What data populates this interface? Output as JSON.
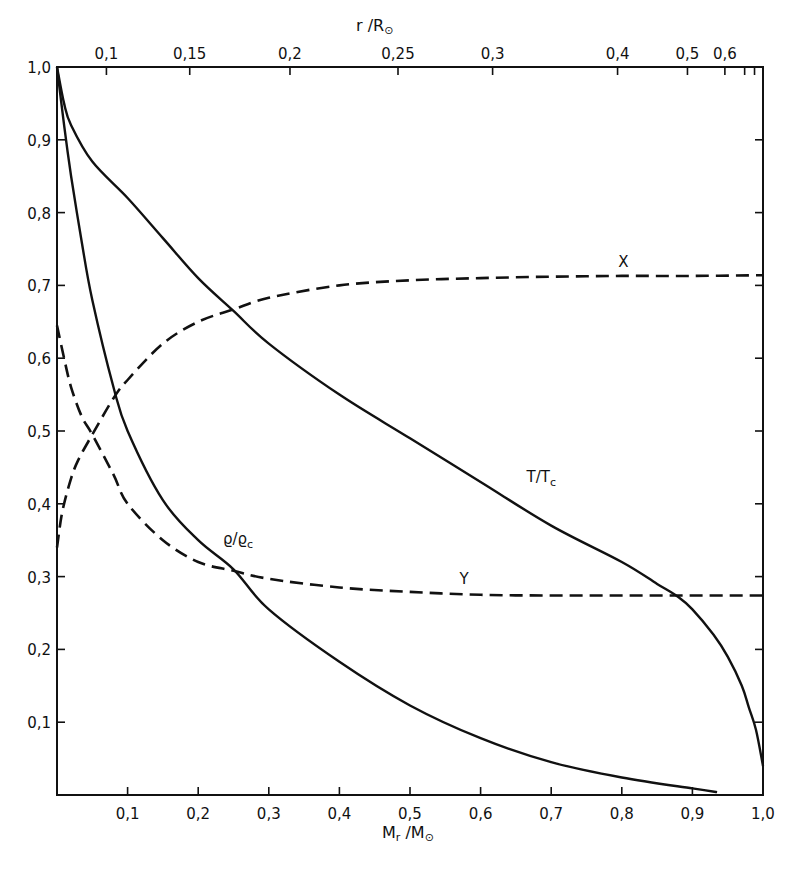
{
  "chart_data": {
    "type": "line",
    "title": "",
    "xlabel": "M_r / M_sun",
    "xlabel_main": "M",
    "xlabel_sub": "r",
    "xlabel_rest": " /M",
    "xlabel_sun": "⊙",
    "ylabel": "",
    "xlim": [
      0,
      1.0
    ],
    "ylim": [
      0,
      1.0
    ],
    "grid": false,
    "x_ticks": [
      {
        "value": 0.1,
        "label": "0,1"
      },
      {
        "value": 0.2,
        "label": "0,2"
      },
      {
        "value": 0.3,
        "label": "0,3"
      },
      {
        "value": 0.4,
        "label": "0,4"
      },
      {
        "value": 0.5,
        "label": "0,5"
      },
      {
        "value": 0.6,
        "label": "0,6"
      },
      {
        "value": 0.7,
        "label": "0,7"
      },
      {
        "value": 0.8,
        "label": "0,8"
      },
      {
        "value": 0.9,
        "label": "0,9"
      },
      {
        "value": 1.0,
        "label": "1,0"
      }
    ],
    "y_ticks": [
      {
        "value": 0.1,
        "label": "0,1"
      },
      {
        "value": 0.2,
        "label": "0,2"
      },
      {
        "value": 0.3,
        "label": "0,3"
      },
      {
        "value": 0.4,
        "label": "0,4"
      },
      {
        "value": 0.5,
        "label": "0,5"
      },
      {
        "value": 0.6,
        "label": "0,6"
      },
      {
        "value": 0.7,
        "label": "0,7"
      },
      {
        "value": 0.8,
        "label": "0,8"
      },
      {
        "value": 0.9,
        "label": "0,9"
      },
      {
        "value": 1.0,
        "label": "1,0"
      }
    ],
    "top_axis": {
      "label_main": "r /R",
      "label_sun": "⊙",
      "ticks": [
        {
          "mass_fraction": 0.07,
          "label": "0,1"
        },
        {
          "mass_fraction": 0.188,
          "label": "0,15"
        },
        {
          "mass_fraction": 0.33,
          "label": "0,2"
        },
        {
          "mass_fraction": 0.483,
          "label": "0,25"
        },
        {
          "mass_fraction": 0.617,
          "label": "0,3"
        },
        {
          "mass_fraction": 0.794,
          "label": "0,4"
        },
        {
          "mass_fraction": 0.893,
          "label": "0,5"
        },
        {
          "mass_fraction": 0.946,
          "label": "0,6"
        },
        {
          "mass_fraction": 0.974,
          "label": ""
        },
        {
          "mass_fraction": 0.988,
          "label": ""
        }
      ]
    },
    "series": [
      {
        "name": "T/Tc",
        "label": "T/T",
        "label_sub": "c",
        "style": "solid",
        "label_at": {
          "x": 0.665,
          "y": 0.43
        },
        "x": [
          0,
          0.01,
          0.02,
          0.05,
          0.1,
          0.15,
          0.2,
          0.25,
          0.3,
          0.4,
          0.5,
          0.6,
          0.7,
          0.8,
          0.85,
          0.88,
          0.9,
          0.93,
          0.95,
          0.97,
          0.98,
          0.99,
          1.0
        ],
        "values": [
          1.0,
          0.95,
          0.92,
          0.87,
          0.82,
          0.765,
          0.71,
          0.665,
          0.62,
          0.55,
          0.49,
          0.43,
          0.37,
          0.32,
          0.29,
          0.272,
          0.255,
          0.22,
          0.19,
          0.15,
          0.12,
          0.09,
          0.04
        ]
      },
      {
        "name": "rho/rho_c",
        "label": "ϱ/ϱ",
        "label_sub": "c",
        "style": "solid",
        "label_at": {
          "x": 0.235,
          "y": 0.345
        },
        "x": [
          0,
          0.01,
          0.02,
          0.035,
          0.05,
          0.08,
          0.1,
          0.15,
          0.2,
          0.25,
          0.3,
          0.4,
          0.5,
          0.6,
          0.7,
          0.8,
          0.9,
          0.935
        ],
        "values": [
          1.0,
          0.92,
          0.85,
          0.76,
          0.68,
          0.56,
          0.5,
          0.405,
          0.35,
          0.31,
          0.255,
          0.183,
          0.123,
          0.078,
          0.045,
          0.024,
          0.009,
          0.004
        ]
      },
      {
        "name": "X",
        "label": "X",
        "style": "dashed",
        "label_at": {
          "x": 0.795,
          "y": 0.725
        },
        "x": [
          0,
          0.005,
          0.01,
          0.02,
          0.03,
          0.05,
          0.08,
          0.1,
          0.15,
          0.2,
          0.25,
          0.3,
          0.4,
          0.5,
          0.6,
          0.7,
          0.8,
          0.9,
          1.0
        ],
        "values": [
          0.34,
          0.375,
          0.4,
          0.435,
          0.46,
          0.495,
          0.545,
          0.57,
          0.62,
          0.65,
          0.667,
          0.683,
          0.7,
          0.707,
          0.71,
          0.712,
          0.713,
          0.713,
          0.714
        ]
      },
      {
        "name": "Y",
        "label": "Y",
        "style": "dashed",
        "label_at": {
          "x": 0.57,
          "y": 0.29
        },
        "x": [
          0,
          0.01,
          0.02,
          0.035,
          0.05,
          0.08,
          0.1,
          0.15,
          0.2,
          0.25,
          0.3,
          0.4,
          0.5,
          0.6,
          0.7,
          0.8,
          0.9,
          1.0
        ],
        "values": [
          0.645,
          0.6,
          0.56,
          0.52,
          0.495,
          0.44,
          0.4,
          0.35,
          0.32,
          0.308,
          0.297,
          0.285,
          0.279,
          0.275,
          0.274,
          0.274,
          0.274,
          0.274
        ]
      }
    ]
  }
}
